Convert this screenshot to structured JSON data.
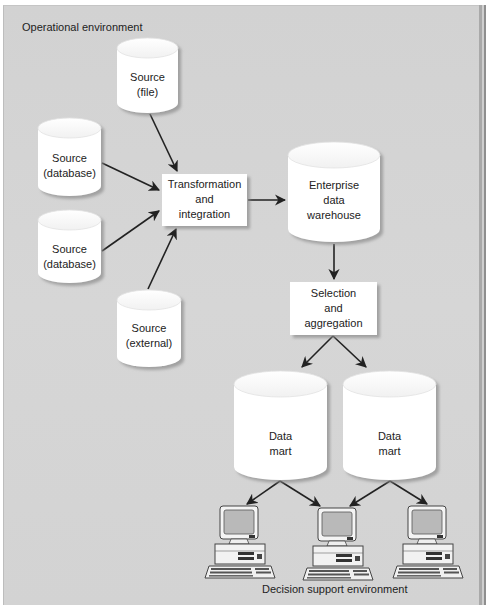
{
  "labels": {
    "operational_environment": "Operational environment",
    "decision_support_environment": "Decision support environment"
  },
  "nodes": {
    "source_file": "Source\n(file)",
    "source_database_1": "Source\n(database)",
    "source_database_2": "Source\n(database)",
    "source_external": "Source\n(external)",
    "transformation": "Transformation\nand\nintegration",
    "warehouse": "Enterprise\ndata\nwarehouse",
    "selection": "Selection\nand\naggregation",
    "data_mart_1": "Data\nmart",
    "data_mart_2": "Data\nmart"
  },
  "edges": [
    {
      "from": "source_file",
      "to": "transformation"
    },
    {
      "from": "source_database_1",
      "to": "transformation"
    },
    {
      "from": "source_database_2",
      "to": "transformation"
    },
    {
      "from": "source_external",
      "to": "transformation"
    },
    {
      "from": "transformation",
      "to": "warehouse"
    },
    {
      "from": "warehouse",
      "to": "selection"
    },
    {
      "from": "selection",
      "to": "data_mart_1"
    },
    {
      "from": "selection",
      "to": "data_mart_2"
    },
    {
      "from": "data_mart_1",
      "to": "workstation_1"
    },
    {
      "from": "data_mart_1",
      "to": "workstation_2"
    },
    {
      "from": "data_mart_2",
      "to": "workstation_2"
    },
    {
      "from": "data_mart_2",
      "to": "workstation_3"
    }
  ],
  "workstations": [
    "workstation-icon",
    "workstation-icon",
    "workstation-icon"
  ],
  "colors": {
    "background": "#d4d4d4",
    "node_fill": "#ffffff",
    "arrow": "#222222",
    "text": "#222222"
  }
}
